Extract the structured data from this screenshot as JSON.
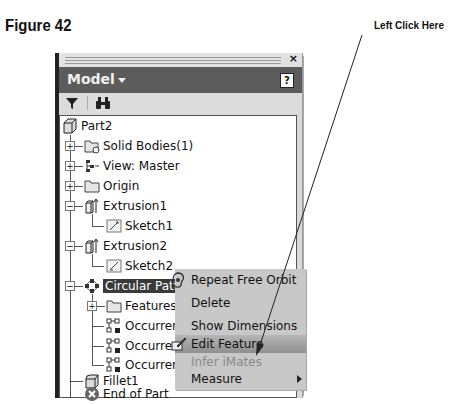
{
  "figure_title": "Figure 42",
  "annotation": "Left Click Here",
  "panel": {
    "close_icon": "×",
    "header_title": "Model",
    "help_icon": "?",
    "toolbar": {
      "filter_icon": "funnel-icon",
      "find_icon": "binoculars-icon"
    }
  },
  "tree": {
    "root": "Part2",
    "items": [
      {
        "label": "Solid Bodies(1)",
        "expander": "+"
      },
      {
        "label": "View: Master",
        "expander": "+"
      },
      {
        "label": "Origin",
        "expander": "+"
      },
      {
        "label": "Extrusion1",
        "expander": "−"
      },
      {
        "label": "Sketch1"
      },
      {
        "label": "Extrusion2",
        "expander": "−"
      },
      {
        "label": "Sketch2"
      },
      {
        "label": "Circular Pattern1",
        "expander": "−",
        "selected": true
      },
      {
        "label": "Features",
        "expander": "+"
      },
      {
        "label": "Occurrence1"
      },
      {
        "label": "Occurrence2"
      },
      {
        "label": "Occurrence3"
      },
      {
        "label": "Fillet1"
      },
      {
        "label": "End of Part"
      }
    ]
  },
  "context_menu": {
    "items": [
      {
        "label": "Repeat Free Orbit",
        "mnemonic": "R",
        "icon": "orbit-icon"
      },
      {
        "label": "Delete",
        "mnemonic": "D"
      },
      {
        "label": "Show Dimensions",
        "mnemonic": "m"
      },
      {
        "label": "Edit Feature",
        "highlighted": true,
        "icon": "edit-feature-icon"
      },
      {
        "label": "Infer iMates",
        "disabled": true
      },
      {
        "label": "Measure",
        "mnemonic": "M",
        "submenu": true
      }
    ]
  }
}
